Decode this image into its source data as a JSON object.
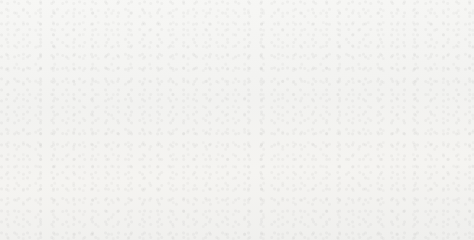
{
  "chart_data": {
    "type": "bar",
    "title": "",
    "subtitle": "",
    "xlabel": "",
    "ylabel": "",
    "ylim": [
      0,
      70
    ],
    "ytick_labels": [
      "0",
      "10%",
      "20%",
      "30%",
      "40%",
      "50%",
      "60%",
      "70%"
    ],
    "ytick_values": [
      0,
      10,
      20,
      30,
      40,
      50,
      60,
      70
    ],
    "grid": false,
    "legend": "none",
    "categories": [
      "2004年",
      "2005年",
      "2006年",
      "2007年",
      "2008年",
      "2009年",
      "2010年"
    ],
    "series": [
      {
        "name": "series-dark",
        "color": "#8d8d8d",
        "values": [
          57.8,
          51.5,
          48.0,
          44.5,
          43.0,
          44.6,
          41.7
        ],
        "labels": [
          "57.8%",
          "51.5%",
          "48.0%",
          "44.5%",
          "43.0%",
          "44.6%",
          "41.7%"
        ]
      },
      {
        "name": "series-light",
        "color": "#c6c6c6",
        "values": [
          23.6,
          30.4,
          35.7,
          39.5,
          40.5,
          41.9,
          45.1
        ],
        "labels": [
          "23.6%",
          "30.4%",
          "35.7%",
          "39.5%",
          "40.5%",
          "41.9%",
          "45.1%"
        ]
      }
    ]
  },
  "colors": {
    "background": "#f4f4f2",
    "axis": "#1c1c1c",
    "text": "#141414",
    "series_dark": "#8d8d8d",
    "series_light": "#c6c6c6"
  }
}
